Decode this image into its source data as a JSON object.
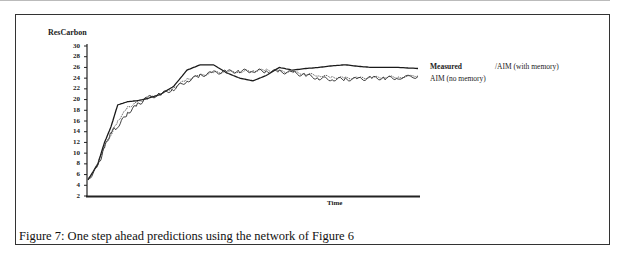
{
  "figure": {
    "caption": "Figure 7: One step ahead predictions using the network of Figure 6"
  },
  "chart_data": {
    "type": "line",
    "title": "",
    "xlabel": "Time",
    "ylabel": "ResCarbon",
    "ylim": [
      2,
      30
    ],
    "yticks": [
      2,
      4,
      6,
      8,
      10,
      12,
      14,
      16,
      18,
      20,
      22,
      24,
      26,
      28,
      30
    ],
    "ytick_labels": [
      "2",
      "4",
      "6",
      "8",
      "10",
      "12",
      "14",
      "16",
      "18",
      "20",
      "22",
      "24",
      "26",
      "28",
      "30"
    ],
    "grid": false,
    "legend_position": "right",
    "legend": [
      "Measured",
      "AIM (no memory)",
      "/AIM (with memory)"
    ],
    "x": [
      0,
      3,
      5,
      7,
      9,
      12,
      15,
      18,
      22,
      26,
      30,
      34,
      38,
      42,
      46,
      50,
      54,
      58,
      62,
      66,
      70,
      74,
      78,
      82,
      86,
      90,
      94,
      100
    ],
    "series": [
      {
        "name": "Measured",
        "values": [
          5,
          8,
          12,
          15,
          19,
          19.6,
          19.8,
          20.2,
          21,
          22.5,
          25.5,
          26.5,
          26.5,
          25,
          24,
          23.5,
          24.5,
          26,
          25.5,
          25.8,
          26,
          26.3,
          26.5,
          26.2,
          26,
          26,
          26,
          25.8
        ]
      },
      {
        "name": "AIM (no memory)",
        "values": [
          5,
          7.5,
          11,
          14,
          15,
          17.5,
          19,
          20.3,
          21,
          22,
          23.5,
          24.5,
          25,
          25.2,
          25.3,
          25.4,
          25.3,
          25.2,
          25,
          24.5,
          24,
          23.8,
          23.8,
          23.8,
          24,
          24,
          24.1,
          24.3
        ]
      },
      {
        "name": "/AIM (with memory)",
        "values": [
          5,
          8,
          11.5,
          13.5,
          16,
          18.5,
          19.5,
          20.2,
          21,
          22.3,
          23.8,
          24.5,
          25,
          25.2,
          25.2,
          25.4,
          25.5,
          25.3,
          25.1,
          24.8,
          24.5,
          24.2,
          24,
          24,
          24.1,
          24.2,
          24.2,
          24.4
        ]
      }
    ]
  }
}
